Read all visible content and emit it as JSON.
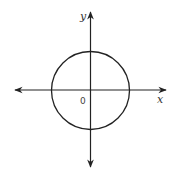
{
  "diagram": {
    "type": "coordinate-plane-circle",
    "axes": {
      "x_label": "x",
      "y_label": "y",
      "origin_label": "0"
    },
    "circle": {
      "center": [
        0,
        0
      ],
      "description": "circle centered at origin"
    },
    "colors": {
      "stroke": "#222222",
      "background": "#ffffff"
    }
  }
}
